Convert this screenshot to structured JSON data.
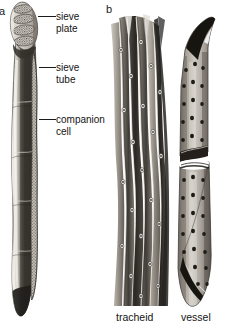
{
  "figure": {
    "caption_panels": {
      "a": "a",
      "b": "b"
    },
    "background_color": "#ffffff",
    "ink_color": "#141414"
  },
  "panel_a": {
    "letter": "a",
    "subject": "phloem sieve tube element with companion cell",
    "labels": [
      {
        "id": "sieve-plate",
        "text": "sieve\nplate"
      },
      {
        "id": "sieve-tube",
        "text": "sieve\ntube"
      },
      {
        "id": "companion-cell",
        "text": "companion\ncell"
      }
    ],
    "label_sieve_plate": "sieve\nplate",
    "label_sieve_tube": "sieve\ntube",
    "label_companion_cell": "companion\ncell"
  },
  "panel_b": {
    "letter": "b",
    "subject": "xylem conducting cells",
    "label_tracheid": "tracheid",
    "label_vessel": "vessel"
  },
  "colors": {
    "cell_dark": "#3d3a36",
    "cell_mid": "#6f6a62",
    "cell_light": "#cfcac2",
    "highlight": "#f1eee9",
    "pit_dark": "#201e1b",
    "outline": "#2b2926"
  }
}
